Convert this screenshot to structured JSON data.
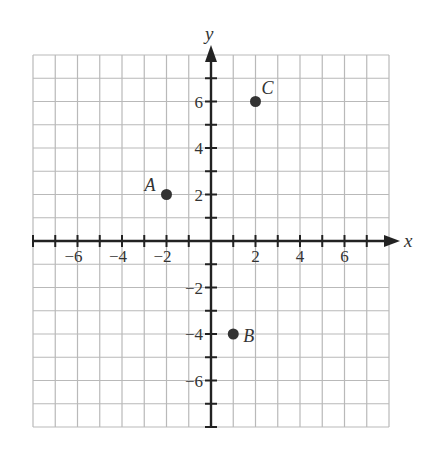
{
  "chart_data": {
    "type": "scatter",
    "title": "",
    "xlabel": "x",
    "ylabel": "y",
    "xlim": [
      -8,
      8
    ],
    "ylim": [
      -8,
      8
    ],
    "grid": true,
    "grid_step": 1,
    "x_tick_labels": [
      "-6",
      "-4",
      "-2",
      "2",
      "4",
      "6"
    ],
    "y_tick_labels": [
      "6",
      "4",
      "2",
      "-2",
      "-4",
      "-6"
    ],
    "points": [
      {
        "label": "A",
        "x": -2,
        "y": 2
      },
      {
        "label": "B",
        "x": 1,
        "y": -4
      },
      {
        "label": "C",
        "x": 2,
        "y": 6
      }
    ]
  },
  "figure": {
    "x_axis_name": "x",
    "y_axis_name": "y",
    "x_ticks": [
      {
        "value": -6,
        "text": "−6"
      },
      {
        "value": -4,
        "text": "−4"
      },
      {
        "value": -2,
        "text": "−2"
      },
      {
        "value": 2,
        "text": "2"
      },
      {
        "value": 4,
        "text": "4"
      },
      {
        "value": 6,
        "text": "6"
      }
    ],
    "y_ticks": [
      {
        "value": 6,
        "text": "6"
      },
      {
        "value": 4,
        "text": "4"
      },
      {
        "value": 2,
        "text": "2"
      },
      {
        "value": -2,
        "text": "−2"
      },
      {
        "value": -4,
        "text": "−4"
      },
      {
        "value": -6,
        "text": "−6"
      }
    ],
    "points": [
      {
        "name": "A",
        "x": -2,
        "y": 2,
        "label_dx": -22,
        "label_dy": -4
      },
      {
        "name": "B",
        "x": 1,
        "y": -4,
        "label_dx": 10,
        "label_dy": 8
      },
      {
        "name": "C",
        "x": 2,
        "y": 6,
        "label_dx": 6,
        "label_dy": -8
      }
    ],
    "colors": {
      "grid": "#b9b9b9",
      "axis": "#222222",
      "point": "#333333",
      "text": "#333333"
    }
  }
}
